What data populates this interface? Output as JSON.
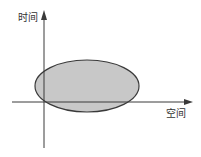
{
  "diagram": {
    "y_axis": {
      "label": "时间"
    },
    "x_axis": {
      "label": "空间"
    },
    "region": {
      "shape": "ellipse",
      "fill": "#c8c8c8",
      "stroke": "#3a3a3a"
    },
    "axis_color": "#3a3a3a"
  }
}
